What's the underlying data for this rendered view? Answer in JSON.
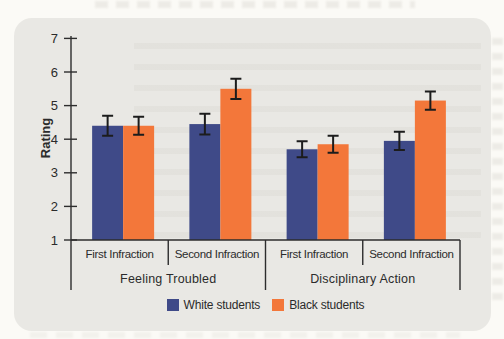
{
  "page": {
    "background_color": "#fbfaf6"
  },
  "panel": {
    "background_color": "#e9e8e4"
  },
  "colors": {
    "white_students_bar": "#3f4a88",
    "black_students_bar": "#f3773a",
    "axis_line": "#2d2d2d",
    "error_bar": "#1c1c1c",
    "label_text": "#2b2b2b"
  },
  "chart_data": {
    "type": "bar",
    "title": "",
    "xlabel": "",
    "ylabel": "Rating",
    "ylim": [
      1,
      7
    ],
    "yticks": [
      1,
      2,
      3,
      4,
      5,
      6,
      7
    ],
    "grid": false,
    "error_bars": true,
    "sections": [
      {
        "label": "Feeling Troubled",
        "categories": [
          "First Infraction",
          "Second Infraction"
        ]
      },
      {
        "label": "Disciplinary Action",
        "categories": [
          "First Infraction",
          "Second Infraction"
        ]
      }
    ],
    "categories": [
      "First Infraction",
      "Second Infraction",
      "First Infraction",
      "Second Infraction"
    ],
    "series": [
      {
        "name": "White students",
        "color": "#3f4a88",
        "values": [
          4.4,
          4.45,
          3.7,
          3.95
        ],
        "errors": [
          0.3,
          0.31,
          0.24,
          0.27
        ]
      },
      {
        "name": "Black students",
        "color": "#f3773a",
        "values": [
          4.4,
          5.5,
          3.85,
          5.15
        ],
        "errors": [
          0.27,
          0.3,
          0.25,
          0.27
        ]
      }
    ],
    "legend": {
      "position": "bottom",
      "items": [
        "White students",
        "Black students"
      ]
    }
  }
}
